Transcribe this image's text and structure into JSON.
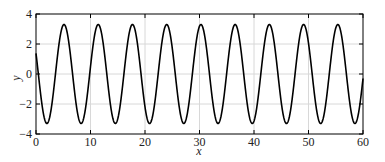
{
  "chart_data": {
    "type": "line",
    "title": "",
    "xlabel": "x",
    "ylabel": "y",
    "xlim": [
      0,
      60
    ],
    "ylim": [
      -4,
      4
    ],
    "xticks": [
      0,
      10,
      20,
      30,
      40,
      50,
      60
    ],
    "yticks": [
      -4,
      -2,
      0,
      2,
      4
    ],
    "grid": true,
    "legend": null,
    "series": [
      {
        "name": "y",
        "color": "#000000",
        "formula": "y = 3.3*sin(x + 2.71)",
        "amplitude": 3.3,
        "period": 6.28,
        "phase": 2.71,
        "x": [
          0,
          2.0,
          5.1,
          8.3,
          11.4,
          14.6,
          17.7,
          20.8,
          24.0,
          27.1,
          30.3,
          33.4,
          36.5,
          39.7,
          42.8,
          46.0,
          49.1,
          52.2,
          55.4,
          58.5,
          60
        ],
        "values": [
          1.38,
          -3.3,
          3.3,
          -3.3,
          3.3,
          -3.3,
          3.3,
          -3.3,
          3.3,
          -3.3,
          3.3,
          -3.3,
          3.3,
          -3.3,
          3.3,
          -3.3,
          3.3,
          -3.3,
          3.3,
          -3.3,
          0.0
        ]
      }
    ]
  }
}
